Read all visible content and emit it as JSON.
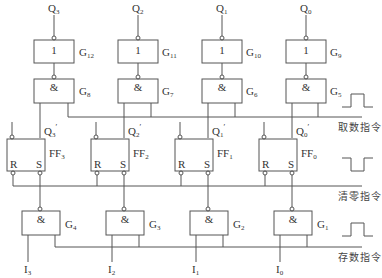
{
  "outputs": [
    {
      "name": "Q",
      "sub": "3"
    },
    {
      "name": "Q",
      "sub": "2"
    },
    {
      "name": "Q",
      "sub": "1"
    },
    {
      "name": "Q",
      "sub": "0"
    }
  ],
  "not_gates": [
    {
      "symbol": "1",
      "label": "G",
      "sub": "12"
    },
    {
      "symbol": "1",
      "label": "G",
      "sub": "11"
    },
    {
      "symbol": "1",
      "label": "G",
      "sub": "10"
    },
    {
      "symbol": "1",
      "label": "G",
      "sub": "9"
    }
  ],
  "fetch_and_gates": [
    {
      "symbol": "&",
      "label": "G",
      "sub": "8"
    },
    {
      "symbol": "&",
      "label": "G",
      "sub": "7"
    },
    {
      "symbol": "&",
      "label": "G",
      "sub": "6"
    },
    {
      "symbol": "&",
      "label": "G",
      "sub": "5"
    }
  ],
  "ff_outputs": [
    {
      "name": "Q",
      "sub": "3",
      "prime": "′"
    },
    {
      "name": "Q",
      "sub": "2",
      "prime": "′"
    },
    {
      "name": "Q",
      "sub": "1",
      "prime": "′"
    },
    {
      "name": "Q",
      "sub": "0",
      "prime": "′"
    }
  ],
  "flip_flops": [
    {
      "label": "FF",
      "sub": "3",
      "r": "R",
      "s": "S"
    },
    {
      "label": "FF",
      "sub": "2",
      "r": "R",
      "s": "S"
    },
    {
      "label": "FF",
      "sub": "1",
      "r": "R",
      "s": "S"
    },
    {
      "label": "FF",
      "sub": "0",
      "r": "R",
      "s": "S"
    }
  ],
  "store_and_gates": [
    {
      "symbol": "&",
      "label": "G",
      "sub": "4"
    },
    {
      "symbol": "&",
      "label": "G",
      "sub": "3"
    },
    {
      "symbol": "&",
      "label": "G",
      "sub": "2"
    },
    {
      "symbol": "&",
      "label": "G",
      "sub": "1"
    }
  ],
  "inputs": [
    {
      "name": "I",
      "sub": "3"
    },
    {
      "name": "I",
      "sub": "2"
    },
    {
      "name": "I",
      "sub": "1"
    },
    {
      "name": "I",
      "sub": "0"
    }
  ],
  "control_lines": {
    "fetch": {
      "label": "取数指令",
      "pulse": "positive"
    },
    "clear": {
      "label": "清零指令",
      "pulse": "negative"
    },
    "store": {
      "label": "存数指令",
      "pulse": "positive"
    }
  }
}
